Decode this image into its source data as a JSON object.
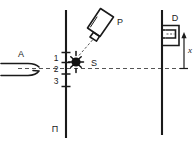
{
  "diagram": {
    "type": "technical-schematic",
    "colors": {
      "stroke": "#1a1a1a",
      "background": "#ffffff",
      "dashed": "#4a4a4a",
      "source_fill": "#111111"
    },
    "labels": {
      "accelerator": "A",
      "probe": "P",
      "source": "S",
      "detector": "D",
      "distance": "x",
      "plate": "П"
    },
    "scale_marks": [
      {
        "value": "1"
      },
      {
        "value": "2"
      },
      {
        "value": "3"
      }
    ],
    "elements": {
      "accelerator_name": "accelerator-beam-tube",
      "probe_name": "probe-applicator",
      "source_name": "radiation-source-point",
      "detector_name": "detector-box",
      "plate_name": "vertical-plate-line",
      "axis_name": "beam-axis-dashed-line",
      "dimension_name": "x-dimension-arrow"
    }
  }
}
